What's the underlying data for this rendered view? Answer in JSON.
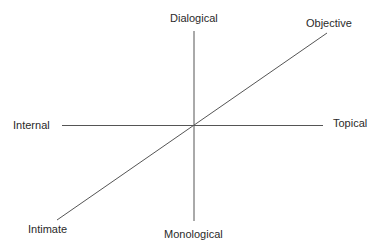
{
  "diagram": {
    "title": "",
    "axes": [
      {
        "name": "dialogical-monological",
        "orientation": "vertical",
        "positive_end": "Dialogical",
        "negative_end": "Monological"
      },
      {
        "name": "internal-topical",
        "orientation": "horizontal",
        "negative_end": "Internal",
        "positive_end": "Topical"
      },
      {
        "name": "intimate-objective",
        "orientation": "diagonal",
        "negative_end": "Intimate",
        "positive_end": "Objective"
      }
    ],
    "labels": {
      "top": "Dialogical",
      "bottom": "Monological",
      "left": "Internal",
      "right": "Topical",
      "bottom_left": "Intimate",
      "top_right": "Objective"
    },
    "colors": {
      "line": "#555555",
      "text": "#2a2a2a",
      "background": "#ffffff"
    }
  }
}
